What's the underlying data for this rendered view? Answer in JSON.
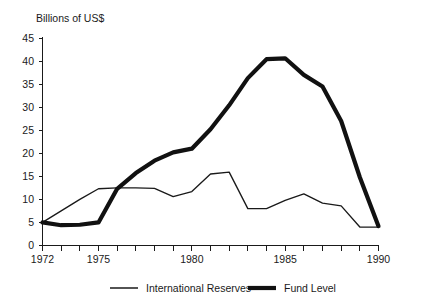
{
  "chart_data": {
    "type": "line",
    "title": "",
    "ylabel": "Billions of US$",
    "xlabel": "",
    "xlim": [
      1972,
      1990
    ],
    "ylim": [
      0,
      45
    ],
    "grid": false,
    "legend_position": "bottom",
    "x": [
      1972,
      1973,
      1974,
      1975,
      1976,
      1977,
      1978,
      1979,
      1980,
      1981,
      1982,
      1983,
      1984,
      1985,
      1986,
      1987,
      1988,
      1989,
      1990
    ],
    "xticks": [
      1972,
      1973,
      1974,
      1975,
      1976,
      1977,
      1978,
      1979,
      1980,
      1981,
      1982,
      1983,
      1984,
      1985,
      1986,
      1987,
      1988,
      1989,
      1990
    ],
    "xtick_labels_shown": [
      "1972",
      "1975",
      "1980",
      "1985",
      "1990"
    ],
    "yticks": [
      0,
      5,
      10,
      15,
      20,
      25,
      30,
      35,
      40,
      45
    ],
    "ytick_labels": [
      "0",
      "5",
      "10",
      "15",
      "20",
      "25",
      "30",
      "35",
      "40",
      "45"
    ],
    "series": [
      {
        "name": "International Reserves",
        "style": "thin",
        "values": [
          5.0,
          7.5,
          10.0,
          12.3,
          12.5,
          12.5,
          12.4,
          10.6,
          11.7,
          15.5,
          15.9,
          8.0,
          8.0,
          9.8,
          11.2,
          9.2,
          8.6,
          4.0,
          4.0
        ]
      },
      {
        "name": "Fund Level",
        "style": "thick",
        "values": [
          5.0,
          4.4,
          4.5,
          5.0,
          12.3,
          15.7,
          18.4,
          20.2,
          21.0,
          25.2,
          30.4,
          36.3,
          40.4,
          40.6,
          37.0,
          34.5,
          27.0,
          14.8,
          4.2
        ]
      }
    ]
  },
  "axes": {
    "y_axis_title": "Billions of US$"
  },
  "legend": {
    "items": [
      {
        "label": "International Reserves",
        "style": "thin"
      },
      {
        "label": "Fund Level",
        "style": "thick"
      }
    ]
  }
}
